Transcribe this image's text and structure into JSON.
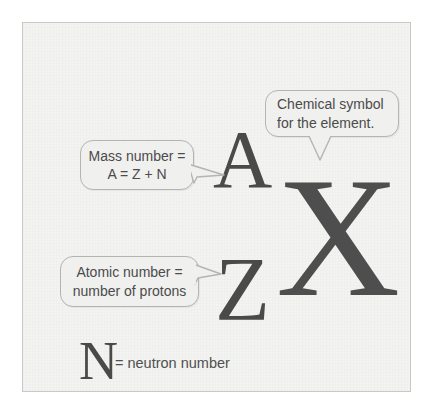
{
  "diagram": {
    "background_color": "#f3f3f1",
    "frame_color": "#c9c9c6",
    "glyph_color": "#4a4a4a",
    "callout_fill": "#f0f0ee",
    "callout_border": "#b4b4b0",
    "text_color": "#4b4b4b"
  },
  "symbols": {
    "mass_number": "A",
    "element": "X",
    "atomic_number": "Z",
    "neutron_number": "N"
  },
  "callouts": {
    "mass": {
      "line1": "Mass number =",
      "line2": "A = Z + N"
    },
    "symbol": {
      "line1": "Chemical symbol",
      "line2": "for the element."
    },
    "atomic": {
      "line1": "Atomic number =",
      "line2": "number of protons"
    }
  },
  "legend": {
    "neutron_note": "= neutron number"
  }
}
